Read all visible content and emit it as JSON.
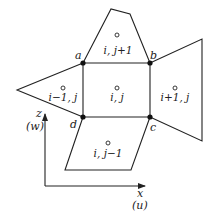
{
  "diagram": {
    "type": "finite-volume-grid-stencil",
    "colors": {
      "stroke": "#222222",
      "node": "#111111",
      "background": "#ffffff"
    },
    "nodes": [
      {
        "id": "a",
        "label": "a",
        "x": 83,
        "y": 63
      },
      {
        "id": "b",
        "label": "b",
        "x": 150,
        "y": 63
      },
      {
        "id": "c",
        "label": "c",
        "x": 150,
        "y": 117
      },
      {
        "id": "d",
        "label": "d",
        "x": 83,
        "y": 117
      }
    ],
    "cells": [
      {
        "id": "center",
        "label": "i, j"
      },
      {
        "id": "top",
        "label": "i, j+1"
      },
      {
        "id": "left",
        "label": "i−1, j"
      },
      {
        "id": "right",
        "label": "i+1, j"
      },
      {
        "id": "bottom",
        "label": "i, j−1"
      }
    ],
    "axes": {
      "vertical": {
        "label": "z",
        "sublabel": "(w)"
      },
      "horizontal": {
        "label": "x",
        "sublabel": "(u)"
      }
    }
  }
}
